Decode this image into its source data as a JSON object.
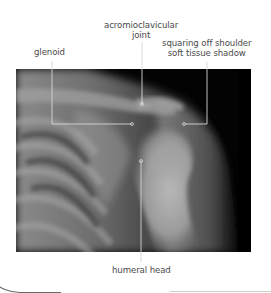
{
  "figure": {
    "labels": [
      {
        "id": "glenoid",
        "text": [
          "glenoid"
        ]
      },
      {
        "id": "acromioclavicular-joint",
        "text": [
          "acromioclavicular",
          "joint"
        ]
      },
      {
        "id": "squaring-off-shoulder",
        "text": [
          "squaring off shoulder",
          "soft tissue shadow"
        ]
      },
      {
        "id": "humeral-head",
        "text": [
          "humeral head"
        ]
      }
    ]
  },
  "colors": {
    "background": "#ffffff",
    "label_text": "#4a4a4a",
    "leader_line": "#d9d9d9",
    "xray_dark": "#000000"
  }
}
